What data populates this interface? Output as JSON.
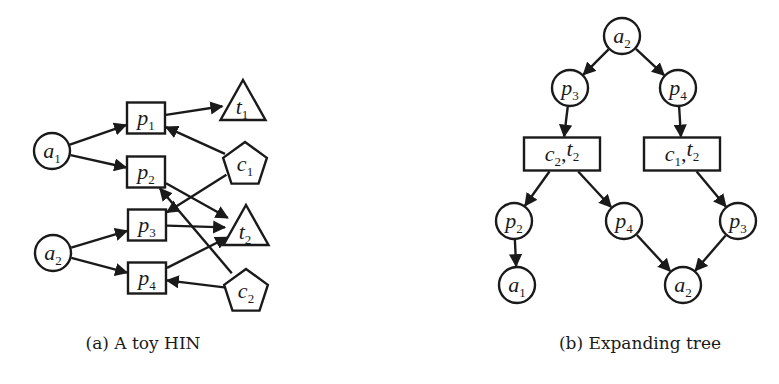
{
  "figure": {
    "panels": [
      {
        "id": "a",
        "caption": "(a) A toy HIN",
        "nodes": [
          {
            "id": "a1",
            "base": "a",
            "sub": "1",
            "shape": "circle",
            "x": 52,
            "y": 151
          },
          {
            "id": "a2",
            "base": "a",
            "sub": "2",
            "shape": "circle",
            "x": 53,
            "y": 253
          },
          {
            "id": "p1",
            "base": "p",
            "sub": "1",
            "shape": "rect",
            "x": 146,
            "y": 118
          },
          {
            "id": "p2",
            "base": "p",
            "sub": "2",
            "shape": "rect",
            "x": 146,
            "y": 172
          },
          {
            "id": "p3",
            "base": "p",
            "sub": "3",
            "shape": "rect",
            "x": 147,
            "y": 225
          },
          {
            "id": "p4",
            "base": "p",
            "sub": "4",
            "shape": "rect",
            "x": 147,
            "y": 278
          },
          {
            "id": "t1",
            "base": "t",
            "sub": "1",
            "shape": "triangle",
            "x": 243,
            "y": 103
          },
          {
            "id": "t2",
            "base": "t",
            "sub": "2",
            "shape": "triangle",
            "x": 246,
            "y": 228
          },
          {
            "id": "c1",
            "base": "c",
            "sub": "1",
            "shape": "pentagon",
            "x": 245,
            "y": 163
          },
          {
            "id": "c2",
            "base": "c",
            "sub": "2",
            "shape": "pentagon",
            "x": 246,
            "y": 290
          }
        ],
        "edges": [
          {
            "from": "a1",
            "to": "p1"
          },
          {
            "from": "a1",
            "to": "p2"
          },
          {
            "from": "a2",
            "to": "p3"
          },
          {
            "from": "a2",
            "to": "p4"
          },
          {
            "from": "p1",
            "to": "t1"
          },
          {
            "from": "c1",
            "to": "p1"
          },
          {
            "from": "c1",
            "to": "p3"
          },
          {
            "from": "p2",
            "to": "t2"
          },
          {
            "from": "c2",
            "to": "p2"
          },
          {
            "from": "p3",
            "to": "t2"
          },
          {
            "from": "p4",
            "to": "t2"
          },
          {
            "from": "c2",
            "to": "p4"
          }
        ]
      },
      {
        "id": "b",
        "caption": "(b) Expanding tree",
        "nodes": [
          {
            "id": "root_a2",
            "base": "a",
            "sub": "2",
            "shape": "circle",
            "x": 622,
            "y": 36
          },
          {
            "id": "l1_p3",
            "base": "p",
            "sub": "3",
            "shape": "circle",
            "x": 570,
            "y": 88
          },
          {
            "id": "l1_p4",
            "base": "p",
            "sub": "4",
            "shape": "circle",
            "x": 678,
            "y": 88
          },
          {
            "id": "l2_c2t2",
            "parts": [
              {
                "base": "c",
                "sub": "2"
              },
              {
                "base": "t",
                "sub": "2"
              }
            ],
            "shape": "wide-rect",
            "x": 562,
            "y": 154
          },
          {
            "id": "l2_c1t2",
            "parts": [
              {
                "base": "c",
                "sub": "1"
              },
              {
                "base": "t",
                "sub": "2"
              }
            ],
            "shape": "wide-rect",
            "x": 682,
            "y": 154
          },
          {
            "id": "l3_p2",
            "base": "p",
            "sub": "2",
            "shape": "circle",
            "x": 514,
            "y": 221
          },
          {
            "id": "l3_p4",
            "base": "p",
            "sub": "4",
            "shape": "circle",
            "x": 624,
            "y": 221
          },
          {
            "id": "l3_p3",
            "base": "p",
            "sub": "3",
            "shape": "circle",
            "x": 738,
            "y": 221
          },
          {
            "id": "l4_a1",
            "base": "a",
            "sub": "1",
            "shape": "circle",
            "x": 517,
            "y": 285
          },
          {
            "id": "l4_a2",
            "base": "a",
            "sub": "2",
            "shape": "circle",
            "x": 683,
            "y": 285
          }
        ],
        "edges": [
          {
            "from": "root_a2",
            "to": "l1_p3"
          },
          {
            "from": "root_a2",
            "to": "l1_p4"
          },
          {
            "from": "l1_p3",
            "to": "l2_c2t2"
          },
          {
            "from": "l1_p4",
            "to": "l2_c1t2"
          },
          {
            "from": "l2_c2t2",
            "to": "l3_p2"
          },
          {
            "from": "l2_c2t2",
            "to": "l3_p4"
          },
          {
            "from": "l2_c1t2",
            "to": "l3_p3"
          },
          {
            "from": "l3_p2",
            "to": "l4_a1"
          },
          {
            "from": "l3_p4",
            "to": "l4_a2"
          },
          {
            "from": "l3_p3",
            "to": "l4_a2"
          }
        ]
      }
    ],
    "captions": {
      "a": "(a) A toy HIN",
      "b": "(b) Expanding tree"
    },
    "colors": {
      "stroke": "#1a1a1a",
      "fill": "#ffffff",
      "background": "#ffffff"
    }
  }
}
